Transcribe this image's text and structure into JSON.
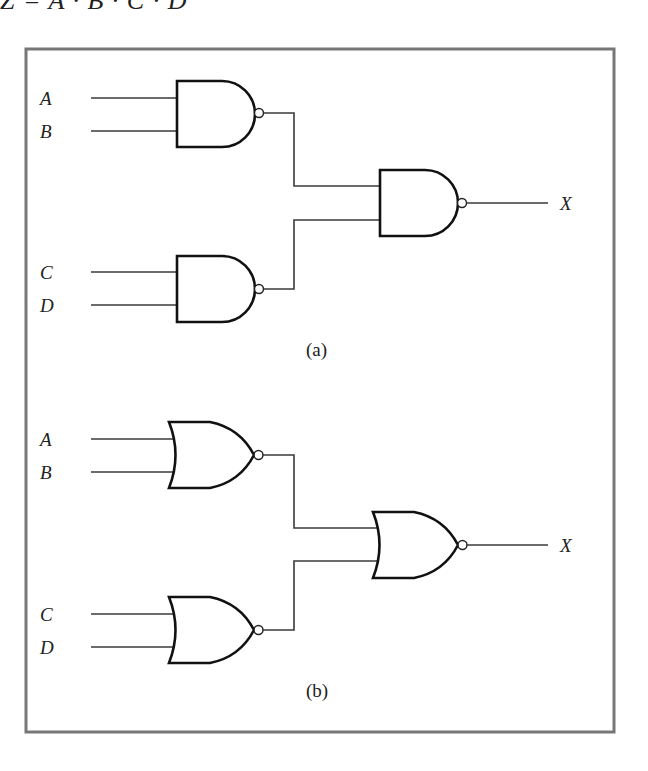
{
  "header": {
    "cropped_expression": "Z = A · B · C · D"
  },
  "figure": {
    "panel_a": {
      "caption": "(a)",
      "gate_type": "NAND",
      "inputs": {
        "a": "A",
        "b": "B",
        "c": "C",
        "d": "D"
      },
      "output": "X"
    },
    "panel_b": {
      "caption": "(b)",
      "gate_type": "NOR",
      "inputs": {
        "a": "A",
        "b": "B",
        "c": "C",
        "d": "D"
      },
      "output": "X"
    }
  },
  "colors": {
    "frame": "#777777",
    "gate_stroke": "#111111",
    "wire": "#3a3a3a",
    "background": "#ffffff"
  }
}
